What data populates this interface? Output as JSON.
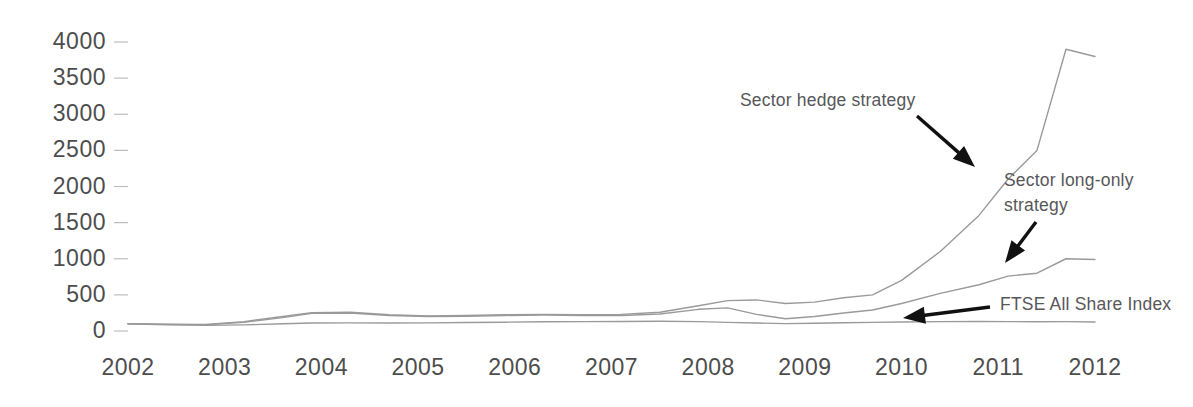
{
  "chart_data": {
    "type": "line",
    "title": "",
    "subtitle": "",
    "xlabel": "",
    "ylabel": "",
    "xlim": [
      2002,
      2012
    ],
    "ylim": [
      0,
      4000
    ],
    "grid": false,
    "legend_position": "inline-annotations",
    "y_ticks": [
      0,
      500,
      1000,
      1500,
      2000,
      2500,
      3000,
      3500,
      4000
    ],
    "y_tick_labels": [
      "0",
      "500",
      "1000",
      "1500",
      "2000",
      "2500",
      "3000",
      "3500",
      "4000"
    ],
    "x_ticks": [
      2002,
      2003,
      2004,
      2005,
      2006,
      2007,
      2008,
      2009,
      2010,
      2011,
      2012
    ],
    "x_tick_labels": [
      "2002",
      "2003",
      "2004",
      "2005",
      "2006",
      "2007",
      "2008",
      "2009",
      "2010",
      "2011",
      "2012"
    ],
    "line_color": "#9a9a9a",
    "x": [
      2002.0,
      2002.4,
      2002.8,
      2003.2,
      2003.6,
      2003.9,
      2004.3,
      2004.7,
      2005.1,
      2005.5,
      2005.9,
      2006.3,
      2006.7,
      2007.1,
      2007.5,
      2007.9,
      2008.2,
      2008.5,
      2008.8,
      2009.1,
      2009.4,
      2009.7,
      2010.0,
      2010.4,
      2010.8,
      2011.1,
      2011.4,
      2011.7,
      2012.0
    ],
    "series": [
      {
        "name": "Sector hedge strategy",
        "values": [
          100,
          95,
          90,
          130,
          200,
          255,
          260,
          225,
          210,
          215,
          225,
          230,
          225,
          230,
          260,
          350,
          420,
          430,
          380,
          400,
          460,
          500,
          700,
          1100,
          1600,
          2100,
          2500,
          3900,
          3800
        ]
      },
      {
        "name": "Sector long-only strategy",
        "values": [
          100,
          92,
          85,
          120,
          185,
          245,
          250,
          215,
          200,
          205,
          215,
          220,
          215,
          215,
          235,
          300,
          320,
          230,
          170,
          200,
          250,
          290,
          380,
          520,
          640,
          760,
          800,
          1000,
          990
        ]
      },
      {
        "name": "FTSE All Share Index",
        "values": [
          100,
          85,
          78,
          85,
          100,
          110,
          112,
          110,
          112,
          118,
          122,
          128,
          130,
          132,
          135,
          130,
          120,
          110,
          102,
          108,
          115,
          120,
          125,
          130,
          132,
          130,
          128,
          130,
          125
        ]
      }
    ],
    "annotations": [
      {
        "name": "sector-hedge-strategy",
        "text": "Sector hedge strategy",
        "lines": [
          "Sector hedge strategy"
        ],
        "label_x": 740,
        "label_y": 106,
        "arrow_from_x": 917,
        "arrow_from_y": 116,
        "arrow_to_x": 975,
        "arrow_to_y": 167
      },
      {
        "name": "sector-long-only-strategy",
        "text": "Sector long-only strategy",
        "lines": [
          "Sector long-only",
          "strategy"
        ],
        "label_x": 1004,
        "label_y": 186,
        "arrow_from_x": 1036,
        "arrow_from_y": 222,
        "arrow_to_x": 1005,
        "arrow_to_y": 263
      },
      {
        "name": "ftse-all-share-index",
        "text": "FTSE All Share Index",
        "lines": [
          "FTSE All Share Index"
        ],
        "label_x": 1000,
        "label_y": 310,
        "arrow_from_x": 990,
        "arrow_from_y": 307,
        "arrow_to_x": 903,
        "arrow_to_y": 318
      }
    ]
  }
}
